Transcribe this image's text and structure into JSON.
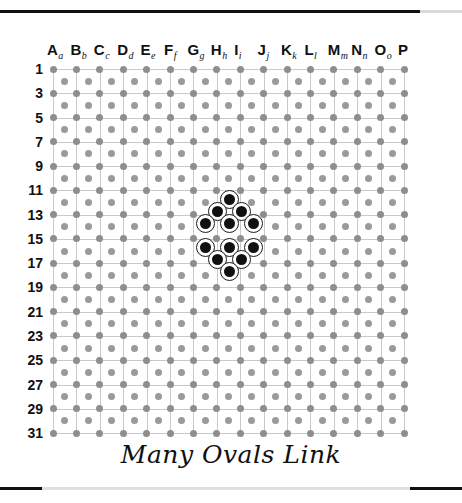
{
  "board": {
    "title": "Many Ovals Link",
    "columns": [
      {
        "letter": "A",
        "sub": "a"
      },
      {
        "letter": "B",
        "sub": "b"
      },
      {
        "letter": "C",
        "sub": "c"
      },
      {
        "letter": "D",
        "sub": "d"
      },
      {
        "letter": "E",
        "sub": "e"
      },
      {
        "letter": "F",
        "sub": "f"
      },
      {
        "letter": "G",
        "sub": "g"
      },
      {
        "letter": "H",
        "sub": "h"
      },
      {
        "letter": "I",
        "sub": "i"
      },
      {
        "letter": "J",
        "sub": "j"
      },
      {
        "letter": "K",
        "sub": "k"
      },
      {
        "letter": "L",
        "sub": "l"
      },
      {
        "letter": "M",
        "sub": "m"
      },
      {
        "letter": "N",
        "sub": "n"
      },
      {
        "letter": "O",
        "sub": "o"
      },
      {
        "letter": "P",
        "sub": ""
      }
    ],
    "row_labels": [
      "1",
      "3",
      "5",
      "7",
      "9",
      "11",
      "13",
      "15",
      "17",
      "19",
      "21",
      "23",
      "25",
      "27",
      "29",
      "31"
    ],
    "grid": {
      "major_columns": 16,
      "major_rows": 16,
      "origin_x": 53,
      "origin_y": 69,
      "step_x": 23.4,
      "step_y": 24.27,
      "line_color": "#c9c9c9",
      "dot_color": "#8e8e8e",
      "dot_radius": 3.5
    },
    "stones": [
      {
        "col": 8,
        "row": 12,
        "x": 229,
        "y": 199
      },
      {
        "col": 7,
        "row": 13,
        "x": 217,
        "y": 211
      },
      {
        "col": 9,
        "row": 13,
        "x": 241,
        "y": 211
      },
      {
        "col": 6,
        "row": 14,
        "x": 205,
        "y": 223
      },
      {
        "col": 8,
        "row": 14,
        "x": 229,
        "y": 223
      },
      {
        "col": 10,
        "row": 14,
        "x": 253,
        "y": 223
      },
      {
        "col": 6,
        "row": 16,
        "x": 205,
        "y": 247
      },
      {
        "col": 8,
        "row": 16,
        "x": 229,
        "y": 247
      },
      {
        "col": 10,
        "row": 16,
        "x": 253,
        "y": 247
      },
      {
        "col": 7,
        "row": 17,
        "x": 217,
        "y": 259
      },
      {
        "col": 9,
        "row": 17,
        "x": 241,
        "y": 259
      },
      {
        "col": 8,
        "row": 18,
        "x": 229,
        "y": 271
      }
    ],
    "stone_style": {
      "ring_color": "#1b1b1b",
      "fill_color": "#111111",
      "inner_white": "#ffffff"
    }
  },
  "rules": {
    "top_color": "#111111",
    "bottom_color": "#111111"
  }
}
